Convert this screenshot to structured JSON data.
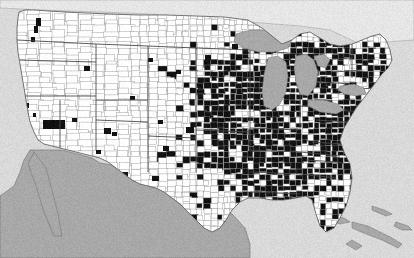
{
  "figure": {
    "kind": "choropleth-map",
    "title": "",
    "width": 414,
    "height": 258,
    "alt_text": "County-level map of the contiguous United States with counties shaded solid black east of roughly the 100th meridian and white elsewhere"
  },
  "colors": {
    "background": "#d9d9d9",
    "ocean": "#d9d9d9",
    "lakes": "#a8a8a8",
    "foreign_land": "#a8a8a8",
    "county_absent": "#ffffff",
    "county_present": "#111111",
    "county_border": "#8a8a8a",
    "state_border": "#4a4a4a",
    "coastline": "#555555"
  },
  "legend": {
    "visible": false,
    "entries": [
      {
        "label": "Present",
        "color": "#111111"
      },
      {
        "label": "Absent",
        "color": "#ffffff"
      },
      {
        "label": "Water / outside study area",
        "color": "#a8a8a8"
      }
    ]
  },
  "chart_data": {
    "type": "heatmap",
    "title": "",
    "subtitle": "",
    "xlabel": "",
    "ylabel": "",
    "legend_position": "none",
    "grid": false,
    "value_scale": "binary",
    "value_labels": {
      "0": "absent (white)",
      "1": "present (black)"
    },
    "projection": "albers-usa-like",
    "region_counts": [
      {
        "region": "Pacific Northwest",
        "share_present": 0.08
      },
      {
        "region": "California",
        "share_present": 0.1
      },
      {
        "region": "Mountain West",
        "share_present": 0.03
      },
      {
        "region": "Great Plains",
        "share_present": 0.12
      },
      {
        "region": "Upper Midwest",
        "share_present": 0.35
      },
      {
        "region": "Ohio Valley",
        "share_present": 0.92
      },
      {
        "region": "Mississippi Valley",
        "share_present": 0.95
      },
      {
        "region": "Southeast",
        "share_present": 0.88
      },
      {
        "region": "Northeast",
        "share_present": 0.55
      },
      {
        "region": "East Texas",
        "share_present": 0.7
      },
      {
        "region": "West Texas",
        "share_present": 0.05
      },
      {
        "region": "Florida",
        "share_present": 0.45
      }
    ]
  },
  "map_regions": [
    {
      "name": "Canada",
      "fill": "foreign_land_light"
    },
    {
      "name": "Mexico",
      "fill": "foreign_land"
    },
    {
      "name": "Great Lakes",
      "fill": "lakes"
    },
    {
      "name": "Atlantic Ocean",
      "fill": "ocean"
    },
    {
      "name": "Pacific Ocean",
      "fill": "ocean"
    },
    {
      "name": "Gulf of Mexico",
      "fill": "ocean"
    },
    {
      "name": "Caribbean islands",
      "fill": "foreign_land"
    }
  ]
}
